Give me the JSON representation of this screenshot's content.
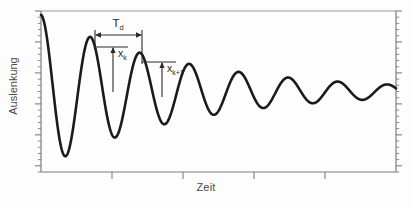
{
  "figure": {
    "title": "",
    "background_color": "#fdfdfd",
    "curve_color": "#1a1a1a",
    "axis_color": "#8a8a8a",
    "annotation_color": "#2b2b2b",
    "label_color": "#4a4a4a"
  },
  "axes": {
    "ylabel": "Auslenkung",
    "xlabel": "Zeit",
    "y_tick_count": 26,
    "x_major_tick_count": 4,
    "frame": {
      "left": 41,
      "right": 396,
      "top": 11,
      "bottom": 172
    }
  },
  "annotations": {
    "period": {
      "label": "T",
      "subscript": "d",
      "text": "Td",
      "x_start": 95,
      "x_end": 142,
      "y": 35
    },
    "amplitude_k": {
      "label": "x",
      "subscript": "k",
      "text": "xk",
      "x": 113,
      "y_top": 47,
      "y_bottom": 92
    },
    "amplitude_k_plus_1": {
      "label": "x",
      "subscript": "k+1",
      "text": "xk+1",
      "x": 162,
      "y_top": 62,
      "y_bottom": 97
    }
  },
  "chart_data": {
    "type": "line",
    "title": "",
    "xlabel": "Zeit",
    "ylabel": "Auslenkung",
    "grid": false,
    "legend": null,
    "xlim": [
      0,
      10.4
    ],
    "ylim": [
      -1.05,
      1.05
    ],
    "model": {
      "equation": "x(t) = A * exp(-delta * t) * cos(2*pi*t/Td)",
      "A": 1.0,
      "decay_delta": 0.235,
      "Td": 1.45,
      "t_start": 0.0,
      "t_end": 10.4
    },
    "peaks": {
      "t": [
        0.0,
        1.45,
        2.9,
        4.35,
        5.8,
        7.25,
        8.7,
        10.15
      ],
      "value": [
        1.0,
        0.711,
        0.506,
        0.36,
        0.256,
        0.182,
        0.129,
        0.092
      ]
    },
    "troughs": {
      "t": [
        0.725,
        2.175,
        3.625,
        5.075,
        6.525,
        7.975,
        9.425
      ],
      "value": [
        -0.843,
        -0.6,
        -0.427,
        -0.303,
        -0.216,
        -0.153,
        -0.109
      ]
    },
    "marked_peaks": {
      "x_k": {
        "t": 1.45,
        "value": 0.711
      },
      "x_k_plus_1": {
        "t": 2.9,
        "value": 0.506
      }
    }
  }
}
